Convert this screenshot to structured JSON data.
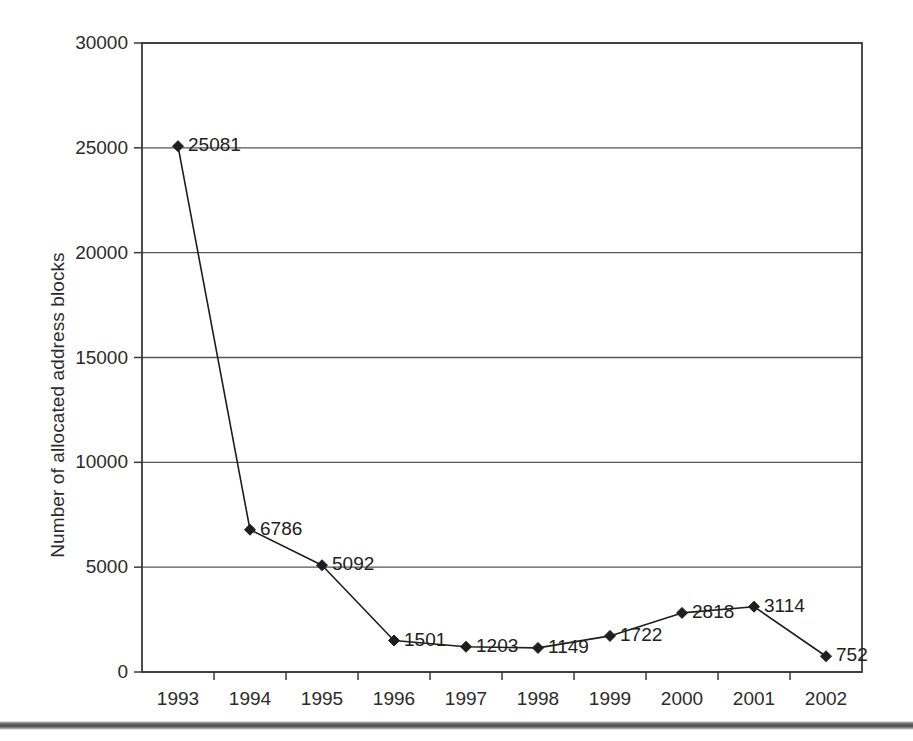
{
  "chart_data": {
    "type": "line",
    "title": "",
    "subtitle": "",
    "xlabel": "",
    "ylabel": "Number of allocated address blocks",
    "categories": [
      "1993",
      "1994",
      "1995",
      "1996",
      "1997",
      "1998",
      "1999",
      "2000",
      "2001",
      "2002"
    ],
    "values": [
      25081,
      6786,
      5092,
      1501,
      1203,
      1149,
      1722,
      2818,
      3114,
      752
    ],
    "data_labels": [
      "25081",
      "6786",
      "5092",
      "1501",
      "1203",
      "1149",
      "1722",
      "2818",
      "3114",
      "752"
    ],
    "ylim": [
      0,
      30000
    ],
    "y_ticks": [
      0,
      5000,
      10000,
      15000,
      20000,
      25000,
      30000
    ],
    "y_tick_labels": [
      "0",
      "5000",
      "10000",
      "15000",
      "20000",
      "25000",
      "30000"
    ],
    "grid": true,
    "grid_axis": "y",
    "legend": false,
    "legend_position": "none",
    "marker": "diamond",
    "series_color": "#1e1e1e",
    "grid_color": "#555555",
    "axis_color": "#3a3a3a",
    "background_color": "#ffffff",
    "series": [
      {
        "name": "Number of allocated address blocks",
        "values": [
          25081,
          6786,
          5092,
          1501,
          1203,
          1149,
          1722,
          2818,
          3114,
          752
        ]
      }
    ],
    "points": [
      {
        "x": "1993",
        "y": 25081,
        "label": "25081"
      },
      {
        "x": "1994",
        "y": 6786,
        "label": "6786"
      },
      {
        "x": "1995",
        "y": 5092,
        "label": "5092"
      },
      {
        "x": "1996",
        "y": 1501,
        "label": "1501"
      },
      {
        "x": "1997",
        "y": 1203,
        "label": "1203"
      },
      {
        "x": "1998",
        "y": 1149,
        "label": "1149"
      },
      {
        "x": "1999",
        "y": 1722,
        "label": "1722"
      },
      {
        "x": "2000",
        "y": 2818,
        "label": "2818"
      },
      {
        "x": "2001",
        "y": 3114,
        "label": "3114"
      },
      {
        "x": "2002",
        "y": 752,
        "label": "752"
      }
    ]
  }
}
